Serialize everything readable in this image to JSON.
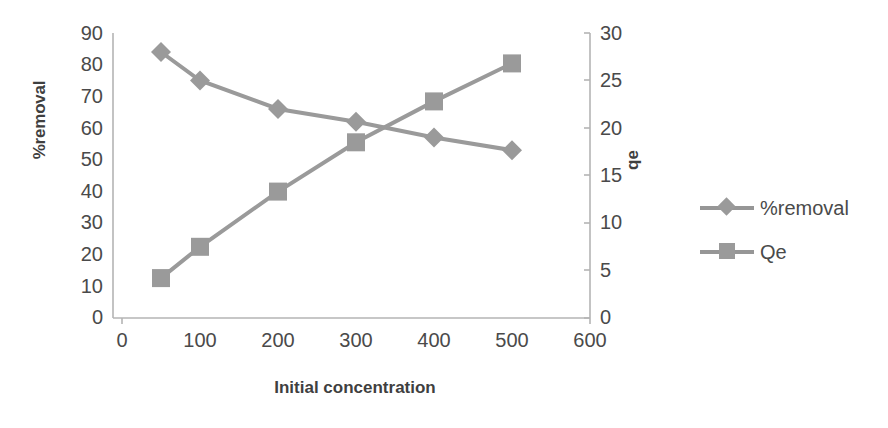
{
  "chart_data": {
    "type": "line",
    "title": "",
    "xlabel": "Initial concentration",
    "ylabel": "%removal",
    "y2label": "qe",
    "x": [
      50,
      100,
      200,
      300,
      400,
      500
    ],
    "xlim": [
      0,
      600
    ],
    "ylim": [
      0,
      90
    ],
    "y2lim": [
      0,
      30
    ],
    "xticks": [
      "0",
      "100",
      "200",
      "300",
      "400",
      "500",
      "600"
    ],
    "yticks": [
      "90",
      "80",
      "70",
      "60",
      "50",
      "40",
      "30",
      "20",
      "10",
      "0"
    ],
    "y2ticks": [
      "30",
      "25",
      "20",
      "15",
      "10",
      "5",
      "0"
    ],
    "grid": false,
    "legend_position": "right",
    "series": [
      {
        "name": "%removal",
        "axis": "left",
        "marker": "diamond",
        "color": "#9a9a9a",
        "values": [
          84,
          75,
          66,
          62,
          57,
          53
        ]
      },
      {
        "name": "Qe",
        "axis": "right",
        "marker": "square",
        "color": "#9a9a9a",
        "values": [
          4.2,
          7.5,
          13.3,
          18.5,
          22.8,
          26.8
        ]
      }
    ]
  },
  "legend": {
    "items": [
      {
        "label": "%removal",
        "marker": "diamond"
      },
      {
        "label": "Qe",
        "marker": "square"
      }
    ]
  },
  "axes": {
    "left_title": "%removal",
    "right_title": "qe",
    "bottom_title": "Initial concentration"
  },
  "colors": {
    "series": "#9a9a9a",
    "axis": "#b0b0b0",
    "text": "#4a4a4a"
  }
}
